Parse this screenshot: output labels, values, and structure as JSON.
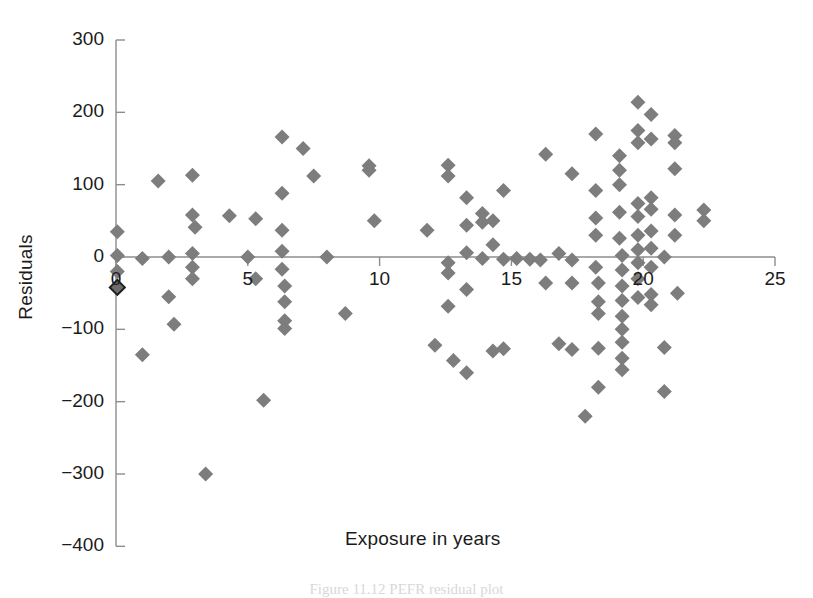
{
  "chart_data": {
    "type": "scatter",
    "title": "",
    "subtitle": "",
    "xlabel": "Exposure in years",
    "ylabel": "Residuals",
    "xlim": [
      0,
      25
    ],
    "ylim": [
      -400,
      300
    ],
    "xticks": [
      0,
      5,
      10,
      15,
      20,
      25
    ],
    "xtick_labels": [
      "0",
      "5",
      "10",
      "15",
      "20",
      "25"
    ],
    "yticks": [
      300,
      200,
      100,
      0,
      -100,
      -200,
      -300,
      -400
    ],
    "ytick_labels": [
      "300",
      "200",
      "100",
      "0",
      "−100",
      "−200",
      "−300",
      "−400"
    ],
    "grid": false,
    "legend": null,
    "marker_shape": "diamond",
    "marker_color": "#7d7d7d",
    "zero_line": true,
    "series": [
      {
        "name": "Residuals vs exposure",
        "points": [
          [
            0.05,
            35
          ],
          [
            0.05,
            2
          ],
          [
            0.05,
            -20
          ],
          [
            0.05,
            -42
          ],
          [
            1.0,
            -2
          ],
          [
            1.0,
            -135
          ],
          [
            1.6,
            105
          ],
          [
            2.0,
            0
          ],
          [
            2.0,
            -55
          ],
          [
            2.2,
            -93
          ],
          [
            2.9,
            113
          ],
          [
            2.9,
            58
          ],
          [
            2.9,
            5
          ],
          [
            2.9,
            -14
          ],
          [
            2.9,
            -30
          ],
          [
            3.0,
            41
          ],
          [
            3.4,
            -300
          ],
          [
            4.3,
            57
          ],
          [
            5.0,
            0
          ],
          [
            5.3,
            53
          ],
          [
            5.3,
            -30
          ],
          [
            5.6,
            -198
          ],
          [
            6.3,
            166
          ],
          [
            6.3,
            88
          ],
          [
            6.3,
            37
          ],
          [
            6.3,
            8
          ],
          [
            6.3,
            -17
          ],
          [
            6.4,
            -40
          ],
          [
            6.4,
            -62
          ],
          [
            6.4,
            -88
          ],
          [
            6.4,
            -99
          ],
          [
            7.1,
            150
          ],
          [
            7.5,
            112
          ],
          [
            8.0,
            0
          ],
          [
            8.7,
            -78
          ],
          [
            9.6,
            126
          ],
          [
            9.6,
            120
          ],
          [
            9.8,
            50
          ],
          [
            11.8,
            37
          ],
          [
            12.1,
            -122
          ],
          [
            12.6,
            127
          ],
          [
            12.6,
            112
          ],
          [
            12.6,
            -8
          ],
          [
            12.6,
            -22
          ],
          [
            12.6,
            -68
          ],
          [
            12.8,
            -143
          ],
          [
            13.3,
            82
          ],
          [
            13.3,
            44
          ],
          [
            13.3,
            6
          ],
          [
            13.3,
            -45
          ],
          [
            13.3,
            -160
          ],
          [
            13.9,
            60
          ],
          [
            13.9,
            48
          ],
          [
            13.9,
            -2
          ],
          [
            14.3,
            50
          ],
          [
            14.3,
            17
          ],
          [
            14.3,
            -130
          ],
          [
            14.7,
            92
          ],
          [
            14.7,
            -3
          ],
          [
            14.7,
            -127
          ],
          [
            15.2,
            -2
          ],
          [
            15.7,
            -3
          ],
          [
            16.1,
            -4
          ],
          [
            16.3,
            142
          ],
          [
            16.3,
            -36
          ],
          [
            16.8,
            5
          ],
          [
            16.8,
            -120
          ],
          [
            17.3,
            115
          ],
          [
            17.3,
            -4
          ],
          [
            17.3,
            -36
          ],
          [
            17.3,
            -128
          ],
          [
            17.8,
            -220
          ],
          [
            18.2,
            170
          ],
          [
            18.2,
            92
          ],
          [
            18.2,
            54
          ],
          [
            18.2,
            30
          ],
          [
            18.2,
            -14
          ],
          [
            18.3,
            -36
          ],
          [
            18.3,
            -62
          ],
          [
            18.3,
            -78
          ],
          [
            18.3,
            -126
          ],
          [
            18.3,
            -180
          ],
          [
            19.1,
            140
          ],
          [
            19.1,
            120
          ],
          [
            19.1,
            100
          ],
          [
            19.1,
            62
          ],
          [
            19.1,
            26
          ],
          [
            19.2,
            2
          ],
          [
            19.2,
            -18
          ],
          [
            19.2,
            -40
          ],
          [
            19.2,
            -60
          ],
          [
            19.2,
            -82
          ],
          [
            19.2,
            -100
          ],
          [
            19.2,
            -118
          ],
          [
            19.2,
            -140
          ],
          [
            19.2,
            -156
          ],
          [
            19.8,
            214
          ],
          [
            19.8,
            175
          ],
          [
            19.8,
            158
          ],
          [
            19.8,
            74
          ],
          [
            19.8,
            56
          ],
          [
            19.8,
            30
          ],
          [
            19.8,
            10
          ],
          [
            19.8,
            -8
          ],
          [
            19.8,
            -30
          ],
          [
            19.8,
            -56
          ],
          [
            20.3,
            197
          ],
          [
            20.3,
            163
          ],
          [
            20.3,
            82
          ],
          [
            20.3,
            66
          ],
          [
            20.3,
            36
          ],
          [
            20.3,
            12
          ],
          [
            20.3,
            -14
          ],
          [
            20.3,
            -52
          ],
          [
            20.3,
            -66
          ],
          [
            20.8,
            0
          ],
          [
            20.8,
            -125
          ],
          [
            20.8,
            -186
          ],
          [
            21.2,
            168
          ],
          [
            21.2,
            158
          ],
          [
            21.2,
            122
          ],
          [
            21.2,
            58
          ],
          [
            21.2,
            30
          ],
          [
            21.3,
            -50
          ],
          [
            22.3,
            65
          ],
          [
            22.3,
            50
          ]
        ]
      }
    ]
  },
  "figure": {
    "caption": "Figure 11.12   PEFR residual plot"
  }
}
